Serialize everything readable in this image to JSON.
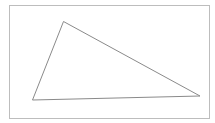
{
  "diagram": {
    "type": "triangle",
    "frame": {
      "x": 9.5,
      "y": 5.5,
      "width": 200,
      "height": 113,
      "stroke": "#bdbdbd"
    },
    "triangle": {
      "vertices": [
        {
          "x": 63.5,
          "y": 21.5
        },
        {
          "x": 32.5,
          "y": 100
        },
        {
          "x": 200,
          "y": 96
        }
      ],
      "stroke": "#8a8a8a",
      "fill": "none"
    }
  }
}
